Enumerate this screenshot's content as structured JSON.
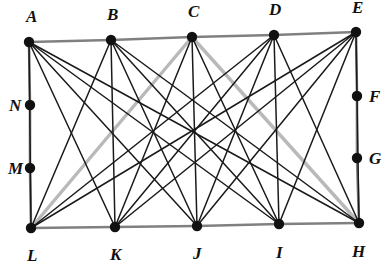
{
  "figure": {
    "width": 383,
    "height": 266,
    "background_color": "#ffffff",
    "colors": {
      "vertex": "#111111",
      "edge_dark": "#1a1a1a",
      "perimeter_gray": "#808080",
      "diagonal_light_gray": "#b9b9b9",
      "label": "#111111"
    },
    "stroke_widths": {
      "edge_dark": 1.5,
      "perimeter_gray": 2.6,
      "diagonal_light_gray": 3.4
    },
    "vertex_radius": 5.2
  },
  "vertices": [
    {
      "id": "A",
      "label": "A",
      "x": 29,
      "y": 42,
      "label_x": 26,
      "label_y": 22,
      "row": "top"
    },
    {
      "id": "B",
      "label": "B",
      "x": 111,
      "y": 40,
      "label_x": 107,
      "label_y": 20,
      "row": "top"
    },
    {
      "id": "C",
      "label": "C",
      "x": 192,
      "y": 37,
      "label_x": 188,
      "label_y": 17,
      "row": "top"
    },
    {
      "id": "D",
      "label": "D",
      "x": 274,
      "y": 35,
      "label_x": 269,
      "label_y": 15,
      "row": "top"
    },
    {
      "id": "E",
      "label": "E",
      "x": 356,
      "y": 32,
      "label_x": 352,
      "label_y": 13,
      "row": "top"
    },
    {
      "id": "F",
      "label": "F",
      "x": 357,
      "y": 96,
      "label_x": 369,
      "label_y": 102,
      "row": "right"
    },
    {
      "id": "G",
      "label": "G",
      "x": 357,
      "y": 158,
      "label_x": 369,
      "label_y": 164,
      "row": "right"
    },
    {
      "id": "H",
      "label": "H",
      "x": 359,
      "y": 223,
      "label_x": 352,
      "label_y": 257,
      "row": "bottom"
    },
    {
      "id": "I",
      "label": "I",
      "x": 279,
      "y": 224,
      "label_x": 276,
      "label_y": 258,
      "row": "bottom"
    },
    {
      "id": "J",
      "label": "J",
      "x": 197,
      "y": 226,
      "label_x": 193,
      "label_y": 259,
      "row": "bottom"
    },
    {
      "id": "K",
      "label": "K",
      "x": 115,
      "y": 227,
      "label_x": 110,
      "label_y": 260,
      "row": "bottom"
    },
    {
      "id": "L",
      "label": "L",
      "x": 31,
      "y": 228,
      "label_x": 27,
      "label_y": 261,
      "row": "bottom"
    },
    {
      "id": "M",
      "label": "M",
      "x": 30,
      "y": 168,
      "label_x": 8,
      "label_y": 174,
      "row": "left"
    },
    {
      "id": "N",
      "label": "N",
      "x": 30,
      "y": 105,
      "label_x": 9,
      "label_y": 111,
      "row": "left"
    }
  ],
  "edges": {
    "perimeter": [
      {
        "from": "A",
        "to": "B",
        "style": "perimeter_gray"
      },
      {
        "from": "B",
        "to": "C",
        "style": "perimeter_gray"
      },
      {
        "from": "C",
        "to": "D",
        "style": "perimeter_gray"
      },
      {
        "from": "D",
        "to": "E",
        "style": "perimeter_gray"
      },
      {
        "from": "E",
        "to": "F",
        "style": "perimeter_gray"
      },
      {
        "from": "F",
        "to": "G",
        "style": "perimeter_gray"
      },
      {
        "from": "G",
        "to": "H",
        "style": "perimeter_gray"
      },
      {
        "from": "H",
        "to": "I",
        "style": "perimeter_gray"
      },
      {
        "from": "I",
        "to": "J",
        "style": "perimeter_gray"
      },
      {
        "from": "J",
        "to": "K",
        "style": "perimeter_gray"
      },
      {
        "from": "K",
        "to": "L",
        "style": "perimeter_gray"
      },
      {
        "from": "L",
        "to": "M",
        "style": "perimeter_gray"
      },
      {
        "from": "M",
        "to": "N",
        "style": "perimeter_gray"
      },
      {
        "from": "N",
        "to": "A",
        "style": "perimeter_gray"
      }
    ],
    "highlighted": [
      {
        "from": "L",
        "to": "C",
        "style": "diagonal_light_gray"
      },
      {
        "from": "C",
        "to": "H",
        "style": "diagonal_light_gray"
      }
    ],
    "bipartite": [
      {
        "from": "A",
        "to": "L",
        "style": "edge_dark"
      },
      {
        "from": "A",
        "to": "K",
        "style": "edge_dark"
      },
      {
        "from": "A",
        "to": "J",
        "style": "edge_dark"
      },
      {
        "from": "A",
        "to": "I",
        "style": "edge_dark"
      },
      {
        "from": "A",
        "to": "H",
        "style": "edge_dark"
      },
      {
        "from": "B",
        "to": "L",
        "style": "edge_dark"
      },
      {
        "from": "B",
        "to": "K",
        "style": "edge_dark"
      },
      {
        "from": "B",
        "to": "J",
        "style": "edge_dark"
      },
      {
        "from": "B",
        "to": "I",
        "style": "edge_dark"
      },
      {
        "from": "B",
        "to": "H",
        "style": "edge_dark"
      },
      {
        "from": "C",
        "to": "K",
        "style": "edge_dark"
      },
      {
        "from": "C",
        "to": "J",
        "style": "edge_dark"
      },
      {
        "from": "C",
        "to": "I",
        "style": "edge_dark"
      },
      {
        "from": "D",
        "to": "L",
        "style": "edge_dark"
      },
      {
        "from": "D",
        "to": "K",
        "style": "edge_dark"
      },
      {
        "from": "D",
        "to": "J",
        "style": "edge_dark"
      },
      {
        "from": "D",
        "to": "I",
        "style": "edge_dark"
      },
      {
        "from": "D",
        "to": "H",
        "style": "edge_dark"
      },
      {
        "from": "E",
        "to": "L",
        "style": "edge_dark"
      },
      {
        "from": "E",
        "to": "K",
        "style": "edge_dark"
      },
      {
        "from": "E",
        "to": "J",
        "style": "edge_dark"
      },
      {
        "from": "E",
        "to": "I",
        "style": "edge_dark"
      },
      {
        "from": "E",
        "to": "H",
        "style": "edge_dark"
      }
    ]
  }
}
